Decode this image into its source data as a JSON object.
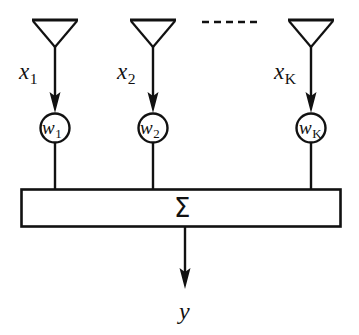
{
  "figure": {
    "stroke_color": "#111111",
    "background_color": "#ffffff",
    "elements": {
      "dashed_separator": "- - - - - -",
      "sum_symbol": "Σ",
      "output_label": "y",
      "output_label_plain": "y"
    },
    "branches": [
      {
        "id": "branch-1",
        "antenna_name": "antenna-1",
        "input_label_base": "x",
        "input_label_sub": "1",
        "weight_label_base": "w",
        "weight_label_sub": "1",
        "center_x": 55
      },
      {
        "id": "branch-2",
        "antenna_name": "antenna-2",
        "input_label_base": "x",
        "input_label_sub": "2",
        "weight_label_base": "w",
        "weight_label_sub": "2",
        "center_x": 153
      },
      {
        "id": "branch-k",
        "antenna_name": "antenna-k",
        "input_label_base": "x",
        "input_label_sub": "K",
        "weight_label_base": "w",
        "weight_label_sub": "K",
        "center_x": 311
      }
    ]
  }
}
